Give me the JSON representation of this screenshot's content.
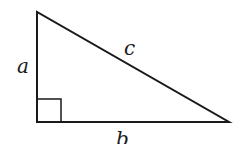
{
  "diagram": {
    "type": "right-triangle",
    "labels": {
      "vertical_leg": "a",
      "horizontal_leg": "b",
      "hypotenuse": "c"
    },
    "right_angle_marker": true,
    "stroke_color": "#1a1a1a",
    "background": "#ffffff"
  }
}
